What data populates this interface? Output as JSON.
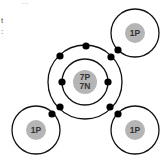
{
  "diagram": {
    "title_fragment": "...",
    "left_fragments": [
      "t",
      ":"
    ],
    "molecule": "ammonia",
    "central_atom": {
      "name": "nitrogen",
      "nucleus_label_lines": [
        "7P",
        "7N"
      ],
      "inner_shell_electrons": 2,
      "outer_shell_electrons": 5
    },
    "bonded_atoms": [
      {
        "name": "hydrogen-top-right",
        "nucleus_label": "1P"
      },
      {
        "name": "hydrogen-bottom-left",
        "nucleus_label": "1P"
      },
      {
        "name": "hydrogen-bottom-right",
        "nucleus_label": "1P"
      }
    ],
    "shared_electrons": 3,
    "colors": {
      "nucleus_fill": "#b5b5b5",
      "shell_stroke": "#111111",
      "electron_fill": "#000000",
      "text": "#333333"
    }
  }
}
